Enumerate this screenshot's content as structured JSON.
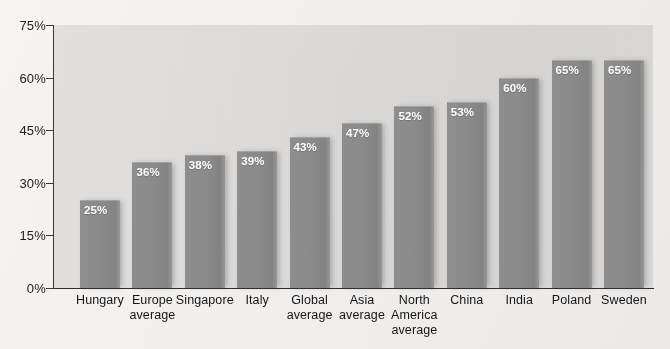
{
  "chart_data": {
    "type": "bar",
    "title": "",
    "subtitle": "",
    "xlabel": "",
    "ylabel": "",
    "ylim": [
      0,
      75
    ],
    "yticks": [
      0,
      15,
      30,
      45,
      60,
      75
    ],
    "ytick_labels": [
      "0%",
      "15%",
      "30%",
      "45%",
      "60%",
      "75%"
    ],
    "grid": false,
    "legend": null,
    "value_suffix": "%",
    "categories": [
      "Hungary",
      "Europe\naverage",
      "Singapore",
      "Italy",
      "Global\naverage",
      "Asia\naverage",
      "North\nAmerica\naverage",
      "China",
      "India",
      "Poland",
      "Sweden"
    ],
    "values": [
      25,
      36,
      38,
      39,
      43,
      47,
      52,
      53,
      60,
      65,
      65
    ],
    "data_labels": [
      "25%",
      "36%",
      "38%",
      "39%",
      "43%",
      "47%",
      "52%",
      "53%",
      "60%",
      "65%",
      "65%"
    ],
    "colors": {
      "bar": "#8a8a8a",
      "plot_background": "#dedddc",
      "page_background": "#f2f0ef",
      "axis": "#2e2e2e",
      "tick_label": "#1d1d1d",
      "category_label": "#161616",
      "data_label": "#ffffff"
    }
  }
}
